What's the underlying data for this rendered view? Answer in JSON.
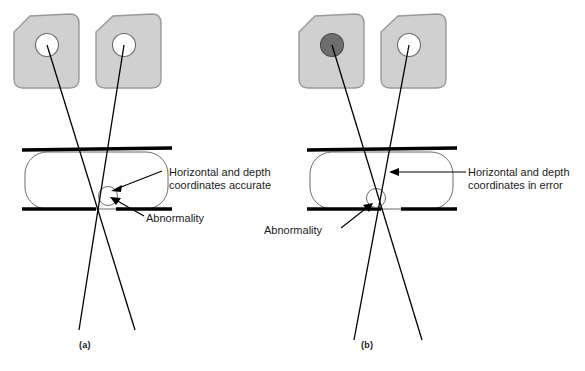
{
  "figure": {
    "background_color": "#ffffff",
    "stroke_color": "#000000",
    "plate_fill": "#d0d0d0",
    "plate_stroke": "#9a9a9a",
    "abnormality_fill": "#6e6e6e",
    "body_stroke": "#555555",
    "paddle_color": "#000000"
  },
  "panels": [
    {
      "id": "a",
      "caption": "(a)",
      "image_plates": [
        {
          "name": "left-image-plate",
          "spot": "open",
          "spot_label": ""
        },
        {
          "name": "right-image-plate",
          "spot": "open",
          "spot_label": ""
        }
      ],
      "annotations": [
        {
          "name": "coordinates-note",
          "line1": "Horizontal and depth",
          "line2": "coordinates accurate"
        },
        {
          "name": "abnormality-note",
          "line1": "Abnormality",
          "line2": ""
        }
      ]
    },
    {
      "id": "b",
      "caption": "(b)",
      "image_plates": [
        {
          "name": "left-image-plate",
          "spot": "filled",
          "spot_label": ""
        },
        {
          "name": "right-image-plate",
          "spot": "open",
          "spot_label": ""
        }
      ],
      "annotations": [
        {
          "name": "coordinates-note",
          "line1": "Horizontal and depth",
          "line2": "coordinates in error"
        },
        {
          "name": "abnormality-note",
          "line1": "Abnormality",
          "line2": ""
        }
      ]
    }
  ]
}
